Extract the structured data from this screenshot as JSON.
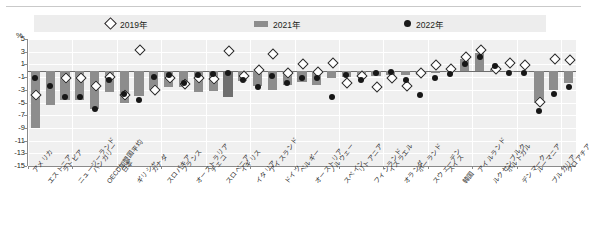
{
  "legend": {
    "items": [
      {
        "label": "2019年",
        "marker": "diamond-outline-marker",
        "color": "#ffffff"
      },
      {
        "label": "2021年",
        "marker": "bar-swatch",
        "color": "#8d8d8d"
      },
      {
        "label": "2022年",
        "marker": "circle-filled-marker",
        "color": "#1a1a1a"
      }
    ]
  },
  "axis": {
    "unit_label": "%",
    "yticks": [
      "5",
      "3",
      "1",
      "-1",
      "-3",
      "-5",
      "-7",
      "-9",
      "-11",
      "-13",
      "-15"
    ]
  },
  "chart_data": {
    "type": "bar",
    "title": "",
    "xlabel": "",
    "ylabel": "%",
    "ylim": [
      -15,
      5
    ],
    "grid": true,
    "legend_position": "top",
    "categories": [
      "アメリカ",
      "エストニア",
      "ラトビア",
      "ニュージーランド",
      "ハンガリー",
      "OECD加盟国平均",
      "日本",
      "ギリシャ",
      "カナダ",
      "スロバキア",
      "フランス",
      "オーストラリア",
      "チェコ",
      "スロベニア",
      "イギリス",
      "イタリア",
      "アイスランド",
      "ドイツ",
      "ベルギー",
      "オーストリア",
      "ノルウェー",
      "スペイン",
      "リトアニア",
      "フィンランド",
      "イスラエル",
      "オランダ",
      "ポーランド",
      "スウェーデン",
      "スイス",
      "韓国",
      "アイルランド",
      "ルクセンブルク",
      "ポルトガル",
      "デンマーク",
      "ルーマニア",
      "ブルガリア",
      "クロアチア"
    ],
    "series": [
      {
        "name": "2021年",
        "type": "bar",
        "color": "#8d8d8d",
        "values": [
          -9.0,
          -5.4,
          -4.6,
          -4.6,
          -6.0,
          -3.4,
          -5.0,
          -4.0,
          -3.0,
          -2.6,
          -2.6,
          -3.4,
          -3.2,
          -4.2,
          -1.6,
          -2.4,
          -3.0,
          -2.2,
          -1.8,
          -2.2,
          -1.2,
          -1.0,
          -0.8,
          -0.8,
          -0.7,
          -0.7,
          -0.6,
          -0.4,
          -0.2,
          1.8,
          2.8,
          0.3,
          -0.1,
          -0.1,
          -5.0,
          -3.0,
          -2.0
        ]
      },
      {
        "name": "2019年",
        "type": "scatter",
        "marker": "diamond",
        "color": "#ffffff",
        "values": [
          -3.6,
          null,
          -1.0,
          -1.0,
          -2.2,
          -0.9,
          -3.6,
          3.4,
          -2.8,
          -1.0,
          -2.0,
          -1.0,
          -1.2,
          3.3,
          -0.6,
          0.2,
          2.8,
          -0.2,
          1.2,
          -0.1,
          1.4,
          -1.7,
          -0.6,
          -2.4,
          -1.0,
          -2.2,
          -0.2,
          1.0,
          0.4,
          2.4,
          3.4,
          0.5,
          1.4,
          1.0,
          -4.8,
          2.0,
          1.8
        ]
      },
      {
        "name": "2022年",
        "type": "scatter",
        "marker": "circle",
        "color": "#1a1a1a",
        "values": [
          -1.2,
          -2.4,
          -4.2,
          -4.2,
          -6.0,
          -1.4,
          -3.6,
          -4.6,
          -1.0,
          -0.6,
          -2.0,
          -0.6,
          -0.5,
          -0.3,
          -1.4,
          -2.6,
          -0.8,
          -2.0,
          -1.2,
          -1.2,
          -4.2,
          -0.6,
          -1.4,
          -0.4,
          -0.2,
          -1.4,
          -3.8,
          -1.2,
          -0.5,
          1.0,
          2.2,
          0.8,
          -0.3,
          -0.3,
          -6.4,
          -3.6,
          -2.6
        ]
      }
    ]
  }
}
